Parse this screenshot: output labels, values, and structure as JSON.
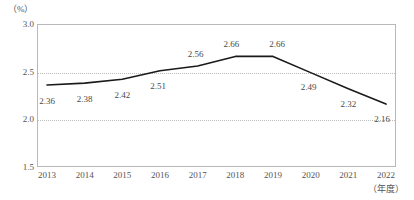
{
  "chart_data": {
    "type": "line",
    "title": "",
    "xlabel": "（年度）",
    "ylabel": "（%）",
    "categories": [
      "2013",
      "2014",
      "2015",
      "2016",
      "2017",
      "2018",
      "2019",
      "2020",
      "2021",
      "2022"
    ],
    "values": [
      2.36,
      2.38,
      2.42,
      2.51,
      2.56,
      2.66,
      2.66,
      2.49,
      2.32,
      2.16
    ],
    "value_labels": [
      "2.36",
      "2.38",
      "2.42",
      "2.51",
      "2.56",
      "2.66",
      "2.66",
      "2.49",
      "2.32",
      "2.16"
    ],
    "ylim": [
      1.5,
      3.0
    ],
    "yticks": [
      3.0,
      2.5,
      2.0,
      1.5
    ],
    "ytick_labels": [
      "3.0",
      "2.5",
      "2.0",
      "1.5"
    ],
    "gridlines_at": [
      2.5,
      2.0
    ],
    "grid": true,
    "legend": "none",
    "series": [
      {
        "name": "",
        "values": [
          2.36,
          2.38,
          2.42,
          2.51,
          2.56,
          2.66,
          2.66,
          2.49,
          2.32,
          2.16
        ],
        "color": "#1a1a1a"
      }
    ]
  },
  "axes": {
    "unit_label": "（%）",
    "x_caption": "（年度）"
  },
  "colors": {
    "line": "#1a1a1a",
    "grid": "#bdbdbd",
    "frame": "#b9b9b9",
    "text": "#555555",
    "label_text": "#4a4a4a"
  }
}
